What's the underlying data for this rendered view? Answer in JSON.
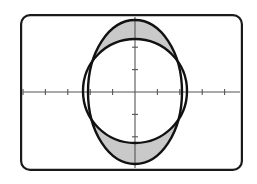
{
  "figure": {
    "name": "graphing-calculator-plot",
    "background_color": "#ffffff",
    "screen": {
      "x": 20,
      "y": 14,
      "width": 223,
      "height": 157,
      "corner_radius": 9,
      "border_color": "#1a1a1a",
      "border_width": 2.2,
      "fill_color": "#ffffff"
    },
    "axes": {
      "origin": {
        "x": 135,
        "y": 92
      },
      "color": "#555555",
      "line_width": 1.1,
      "tick_length": 6,
      "tick_spacing": 22.4,
      "x_axis": {
        "start_x": 23,
        "end_x": 240,
        "y": 92
      },
      "y_axis": {
        "x": 135,
        "start_y": 17,
        "end_y": 168
      },
      "x_ticks": [
        -5,
        -4,
        -3,
        -2,
        -1,
        1,
        2,
        3,
        4,
        5
      ],
      "y_ticks": [
        -2,
        -1,
        1,
        2
      ]
    },
    "curves": [
      {
        "name": "ellipse-curve",
        "type": "ellipse",
        "center": {
          "x": 135,
          "y": 92
        },
        "rx": 47,
        "ry": 72,
        "stroke": "#111111",
        "stroke_width": 2.4,
        "fill": "none"
      },
      {
        "name": "circle-curve",
        "type": "circle",
        "center": {
          "x": 135,
          "y": 91
        },
        "r": 52,
        "stroke": "#111111",
        "stroke_width": 2.4,
        "fill": "none"
      }
    ],
    "shaded_regions": [
      {
        "name": "upper-lens-region",
        "fill": "#c9c9c9",
        "description": "region inside ellipse above circle"
      },
      {
        "name": "lower-lens-region",
        "fill": "#c9c9c9",
        "description": "region inside ellipse below circle"
      }
    ]
  },
  "chart_data": {
    "type": "line",
    "title": "",
    "subtitle": "",
    "xlabel": "",
    "ylabel": "",
    "grid": false,
    "legend_position": "none",
    "xlim": [
      -5,
      5
    ],
    "ylim": [
      -3.4,
      3.4
    ],
    "xtick_labels": [
      "-5",
      "-4",
      "-3",
      "-2",
      "-1",
      "1",
      "2",
      "3",
      "4",
      "5"
    ],
    "ytick_labels": [
      "-2",
      "-1",
      "1",
      "2"
    ],
    "series": [
      {
        "name": "ellipse",
        "equation": "x^2/4.4 + y^2/10.4 = 1",
        "semi_axis_x": 2.1,
        "semi_axis_y": 3.22,
        "center": [
          0,
          0
        ]
      },
      {
        "name": "circle",
        "equation": "x^2 + y^2 = 5.4",
        "radius": 2.32,
        "center": [
          0,
          0
        ]
      }
    ],
    "annotations": [
      {
        "name": "shaded-area",
        "text": "region between ellipse and circle (two lens shapes, top and bottom)",
        "fill": "#c9c9c9"
      }
    ]
  }
}
